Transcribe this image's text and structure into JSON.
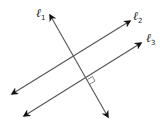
{
  "diagram": {
    "title": "",
    "lines": [
      {
        "id": "l1",
        "label": "ℓ",
        "subscript": "1",
        "from": [
          108,
          117
        ],
        "to": [
          50,
          15
        ]
      },
      {
        "id": "l2",
        "label": "ℓ",
        "subscript": "2",
        "from": [
          12,
          94
        ],
        "to": [
          130,
          21
        ]
      },
      {
        "id": "l3",
        "label": "ℓ",
        "subscript": "3",
        "from": [
          24,
          116
        ],
        "to": [
          141,
          43
        ]
      }
    ],
    "annotations": {
      "right_angle": "ℓ1 ⊥ ℓ3",
      "parallel": "ℓ2 ∥ ℓ3"
    },
    "colors": {
      "stroke": "#555555",
      "arrow": "#111111",
      "text": "#222222"
    }
  }
}
